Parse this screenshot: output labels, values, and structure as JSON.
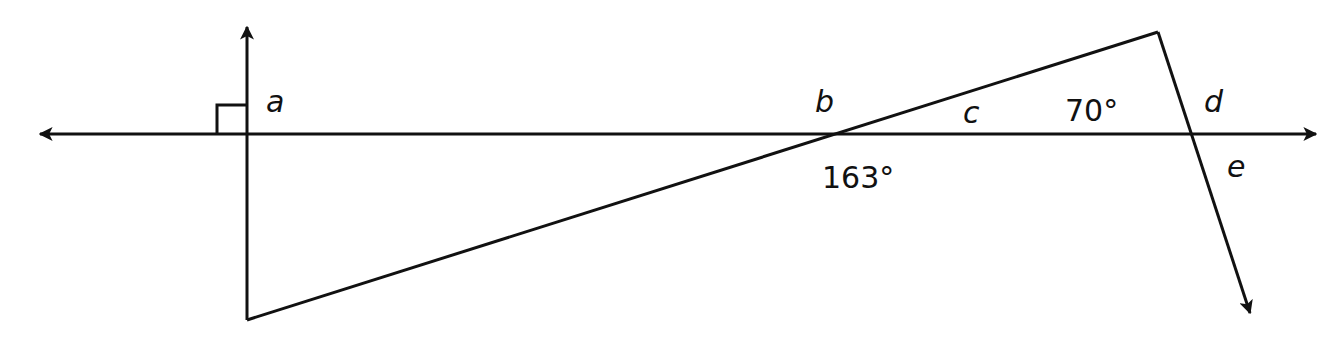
{
  "diagram": {
    "type": "geometry-angles",
    "stroke_color": "#111111",
    "background": "#ffffff",
    "labels": {
      "a": "a",
      "b": "b",
      "c": "c",
      "d": "d",
      "e": "e",
      "angle_163": "163°",
      "angle_70": "70°"
    },
    "marks": {
      "right_angle": "right-angle-mark"
    }
  }
}
